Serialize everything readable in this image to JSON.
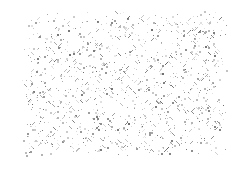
{
  "image": {
    "description": "Speckled grayscale noise texture on white background",
    "width": 239,
    "height": 171,
    "background": "#ffffff"
  },
  "speckle": {
    "region": {
      "x0": 20,
      "y0": 10,
      "x1": 228,
      "y1": 158
    },
    "edge_fade": 12,
    "dot_count": 1400,
    "seed": 20240611,
    "colors": [
      "#d8d8d8",
      "#c4c4c4",
      "#b0b0b0",
      "#9a9a9a",
      "#888888",
      "#777777",
      "#666666"
    ],
    "dot_sizes": [
      1,
      1,
      1,
      2
    ],
    "streak_probability": 0.18
  }
}
